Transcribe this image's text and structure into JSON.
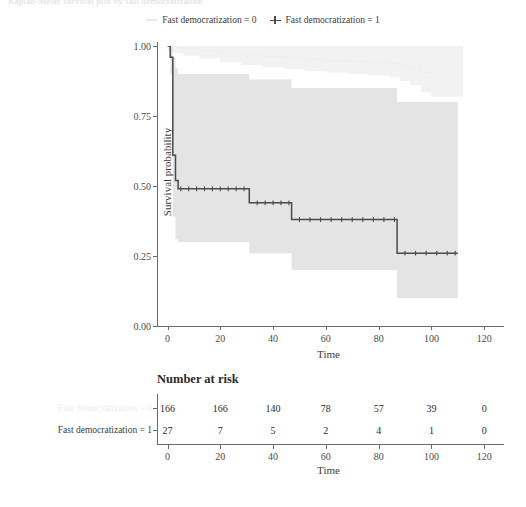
{
  "top_cropped_text": "Kaplan-Meier survival plot by fast democratization",
  "legend": {
    "items": [
      {
        "label": "Fast democratization = 0",
        "marker": "dash-line-icon",
        "color": "#e8e8e8"
      },
      {
        "label": "Fast democratization = 1",
        "marker": "plus-censor-icon",
        "color": "#4a4a4a"
      }
    ]
  },
  "axes": {
    "x_label": "Time",
    "y_label": "Survival probability",
    "x_ticks": [
      "0",
      "20",
      "40",
      "60",
      "80",
      "100",
      "120"
    ],
    "y_ticks": [
      "0.00",
      "0.25",
      "0.50",
      "0.75",
      "1.00"
    ]
  },
  "risk_table": {
    "title": "Number at risk",
    "x_label": "Time",
    "x_ticks": [
      "0",
      "20",
      "40",
      "60",
      "80",
      "100",
      "120"
    ],
    "rows": [
      {
        "label": "Fast democratization = 0",
        "color": "#ededed",
        "values": [
          "166",
          "166",
          "140",
          "78",
          "57",
          "39",
          "0"
        ]
      },
      {
        "label": "Fast democratization = 1",
        "color": "#3b3b3b",
        "values": [
          "27",
          "7",
          "5",
          "2",
          "4",
          "1",
          "0"
        ]
      }
    ]
  },
  "chart_data": {
    "type": "line",
    "title": "",
    "xlabel": "Time",
    "ylabel": "Survival probability",
    "xlim": [
      -4,
      126
    ],
    "ylim": [
      0.0,
      1.0
    ],
    "grid": false,
    "legend_position": "top",
    "series": [
      {
        "name": "Fast democratization = 0",
        "color": "#ededed",
        "band_color": "#f2f2f2",
        "style": "step",
        "x": [
          0,
          2,
          6,
          12,
          20,
          28,
          36,
          44,
          52,
          60,
          68,
          76,
          84,
          88,
          92,
          96,
          100,
          104,
          108,
          112
        ],
        "y": [
          1.0,
          0.995,
          0.99,
          0.985,
          0.975,
          0.968,
          0.962,
          0.958,
          0.952,
          0.948,
          0.945,
          0.942,
          0.938,
          0.93,
          0.92,
          0.905,
          0.9,
          0.9,
          0.9,
          0.9
        ],
        "ci_lower": [
          0.98,
          0.975,
          0.965,
          0.955,
          0.942,
          0.932,
          0.925,
          0.918,
          0.91,
          0.905,
          0.9,
          0.895,
          0.888,
          0.875,
          0.86,
          0.835,
          0.82,
          0.82,
          0.82,
          0.82
        ],
        "ci_upper": [
          1.0,
          1.0,
          1.0,
          1.0,
          1.0,
          1.0,
          1.0,
          1.0,
          1.0,
          1.0,
          1.0,
          1.0,
          1.0,
          1.0,
          1.0,
          1.0,
          1.0,
          1.0,
          1.0,
          1.0
        ]
      },
      {
        "name": "Fast democratization = 1",
        "color": "#4a4a4a",
        "band_color": "#e4e4e4",
        "style": "step",
        "x": [
          0,
          1,
          2,
          3,
          4,
          31,
          47,
          87,
          110
        ],
        "y": [
          1.0,
          0.96,
          0.61,
          0.52,
          0.49,
          0.44,
          0.38,
          0.26,
          0.26
        ],
        "ci_lower": [
          1.0,
          0.9,
          0.39,
          0.31,
          0.3,
          0.26,
          0.2,
          0.1,
          0.1
        ],
        "ci_upper": [
          1.0,
          1.0,
          0.96,
          0.92,
          0.9,
          0.88,
          0.85,
          0.8,
          0.8
        ],
        "censor_marks": [
          5,
          8,
          11,
          14,
          17,
          20,
          23,
          26,
          29,
          34,
          37,
          40,
          43,
          46,
          50,
          54,
          58,
          62,
          66,
          70,
          74,
          78,
          82,
          86,
          90,
          94,
          98,
          102,
          106,
          109
        ]
      }
    ]
  }
}
